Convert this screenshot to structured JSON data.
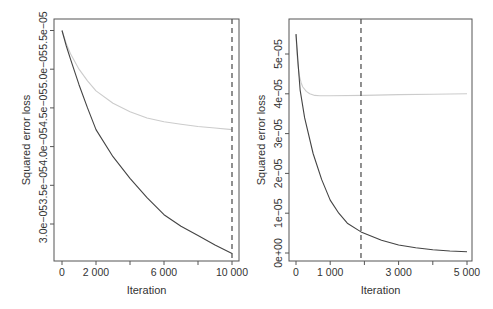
{
  "chart_data": [
    {
      "type": "line",
      "panel": "left",
      "title": "",
      "xlabel": "Iteration",
      "ylabel": "Squared error loss",
      "xlim": [
        0,
        10000
      ],
      "ylim": [
        2.6e-05,
        5.5e-05
      ],
      "x_ticks": [
        0,
        2000,
        4000,
        6000,
        8000,
        10000
      ],
      "x_tick_labels": [
        "0",
        "2 000",
        "",
        "6 000",
        "",
        "10 000"
      ],
      "y_ticks": [
        3e-05,
        3.5e-05,
        4e-05,
        4.5e-05,
        5e-05,
        5.5e-05
      ],
      "y_tick_labels": [
        "3.0e−05",
        "3.5e−05",
        "4.0e−05",
        "4.5e−05",
        "5.0e−05",
        "5.5e−05"
      ],
      "grid": false,
      "vline": {
        "x": 10000,
        "style": "dashed",
        "color": "#555555"
      },
      "series": [
        {
          "name": "training loss (dark)",
          "color": "#444444",
          "x": [
            0,
            250,
            500,
            1000,
            1500,
            2000,
            3000,
            4000,
            5000,
            6000,
            7000,
            8000,
            9000,
            10000
          ],
          "values": [
            5.5e-05,
            5.3e-05,
            5.13e-05,
            4.8e-05,
            4.5e-05,
            4.22e-05,
            3.87e-05,
            3.59e-05,
            3.34e-05,
            3.12e-05,
            2.97e-05,
            2.85e-05,
            2.73e-05,
            2.62e-05
          ]
        },
        {
          "name": "validation loss (light gray)",
          "color": "#cccccc",
          "x": [
            0,
            250,
            500,
            1000,
            1500,
            2000,
            3000,
            4000,
            5000,
            6000,
            7000,
            8000,
            9000,
            10000
          ],
          "values": [
            5.5e-05,
            5.33e-05,
            5.2e-05,
            5e-05,
            4.85e-05,
            4.72e-05,
            4.56e-05,
            4.45e-05,
            4.37e-05,
            4.32e-05,
            4.29e-05,
            4.26e-05,
            4.24e-05,
            4.22e-05
          ]
        }
      ]
    },
    {
      "type": "line",
      "panel": "right",
      "title": "",
      "xlabel": "Iteration",
      "ylabel": "Squared error loss",
      "xlim": [
        0,
        5000
      ],
      "ylim": [
        0,
        5.5e-05
      ],
      "x_ticks": [
        0,
        1000,
        2000,
        3000,
        4000,
        5000
      ],
      "x_tick_labels": [
        "0",
        "1 000",
        "",
        "3 000",
        "",
        "5 000"
      ],
      "y_ticks": [
        0,
        1e-05,
        2e-05,
        3e-05,
        4e-05,
        5e-05
      ],
      "y_tick_labels": [
        "0e+00",
        "1e−05",
        "2e−05",
        "3e−05",
        "4e−05",
        "5e−05"
      ],
      "grid": false,
      "vline": {
        "x": 1900,
        "style": "dashed",
        "color": "#555555"
      },
      "series": [
        {
          "name": "training loss (dark)",
          "color": "#444444",
          "x": [
            0,
            60,
            120,
            250,
            500,
            750,
            1000,
            1250,
            1500,
            1900,
            2500,
            3000,
            3500,
            4000,
            4500,
            5000
          ],
          "values": [
            5.5e-05,
            4.75e-05,
            4.1e-05,
            3.4e-05,
            2.5e-05,
            1.85e-05,
            1.33e-05,
            1e-05,
            7.5e-06,
            5.3e-06,
            3.2e-06,
            2e-06,
            1.3e-06,
            8e-07,
            5e-07,
            3e-07
          ]
        },
        {
          "name": "validation loss (light gray)",
          "color": "#cccccc",
          "x": [
            0,
            30,
            60,
            100,
            150,
            200,
            300,
            400,
            550,
            700,
            1000,
            2000,
            3000,
            4000,
            5000
          ],
          "values": [
            5.5e-05,
            5e-05,
            4.7e-05,
            4.45e-05,
            4.28e-05,
            4.17e-05,
            4.06e-05,
            4e-05,
            3.96e-05,
            3.95e-05,
            3.95e-05,
            3.96e-05,
            3.98e-05,
            3.99e-05,
            4e-05
          ]
        }
      ]
    }
  ],
  "layout": {
    "panels": [
      {
        "box": {
          "x0": 54,
          "y0": 19,
          "x1": 239,
          "y1": 261
        },
        "px": {
          "x0": 62,
          "xScale": 0.017
        },
        "py": {
          "ref": 5.5e-05,
          "refY": 30.5,
          "pxPerUnit": 7740000.0
        }
      },
      {
        "box": {
          "x0": 289,
          "y0": 19,
          "x1": 472,
          "y1": 261
        },
        "px": {
          "x0": 296,
          "xScale": 0.0342
        },
        "py": {
          "ref": 0,
          "refY": 253,
          "pxPerUnit": 3980000.0
        }
      }
    ]
  }
}
